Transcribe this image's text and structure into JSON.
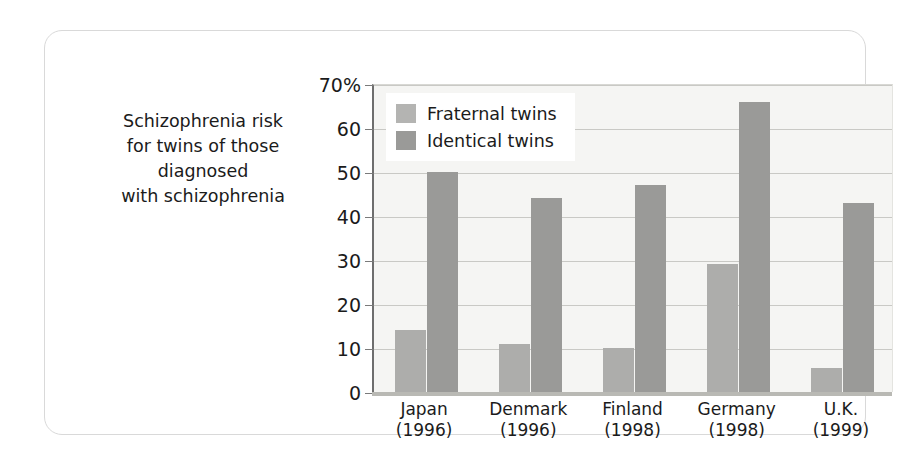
{
  "caption": {
    "lines": [
      "Schizophrenia risk",
      "for twins of those",
      "diagnosed",
      "with schizophrenia"
    ]
  },
  "legend": {
    "items": [
      {
        "label": "Fraternal twins",
        "color": "#b4b4b2"
      },
      {
        "label": "Identical twins",
        "color": "#9a9a98"
      }
    ]
  },
  "axis": {
    "y_ticks": [
      "70%",
      "60",
      "50",
      "40",
      "30",
      "20",
      "10",
      "0"
    ],
    "x_labels": [
      {
        "name": "Japan",
        "year": "(1996)"
      },
      {
        "name": "Denmark",
        "year": "(1996)"
      },
      {
        "name": "Finland",
        "year": "(1998)"
      },
      {
        "name": "Germany",
        "year": "(1998)"
      },
      {
        "name": "U.K.",
        "year": "(1999)"
      }
    ]
  },
  "chart_data": {
    "type": "bar",
    "title": "Schizophrenia risk for twins of those diagnosed with schizophrenia",
    "xlabel": "",
    "ylabel": "",
    "ylim": [
      0,
      70
    ],
    "yticks": [
      0,
      10,
      20,
      30,
      40,
      50,
      60,
      70
    ],
    "grid": true,
    "legend_position": "top-left",
    "categories": [
      "Japan (1996)",
      "Denmark (1996)",
      "Finland (1998)",
      "Germany (1998)",
      "U.K. (1999)"
    ],
    "series": [
      {
        "name": "Fraternal twins",
        "color": "#adadab",
        "values": [
          14,
          11,
          10,
          29,
          5.5
        ]
      },
      {
        "name": "Identical twins",
        "color": "#9a9a98",
        "values": [
          50,
          44,
          47,
          66,
          43
        ]
      }
    ]
  }
}
